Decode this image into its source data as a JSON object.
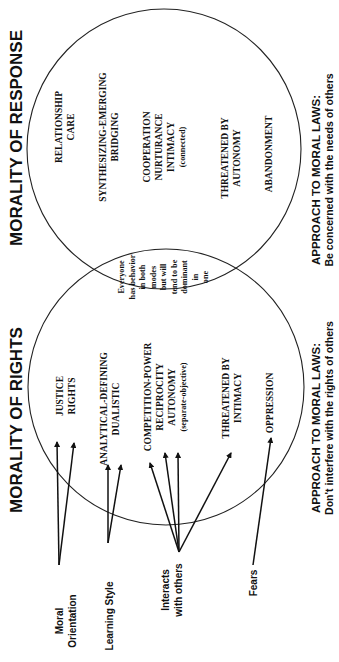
{
  "diagram": {
    "orientation": "rotated 90 degrees counter-clockwise",
    "response": {
      "title": "MORALITY OF RESPONSE",
      "lines": [
        [
          "RELATIONSHIP",
          "CARE"
        ],
        [
          "SYNTHESIZING-EMERGING",
          "BRIDGING"
        ],
        [
          "COOPERATION",
          "NURTURANCE",
          "INTIMACY",
          "(connected)"
        ],
        [
          "THREATENED BY",
          "AUTONOMY"
        ],
        [
          "ABANDONMENT"
        ]
      ],
      "approach_heading": "APPROACH TO MORAL LAWS:",
      "approach_text": "Be concerned with the needs of others"
    },
    "rights": {
      "title": "MORALITY OF RIGHTS",
      "lines": [
        [
          "JUSTICE",
          "RIGHTS"
        ],
        [
          "ANALYTICAL-DEFINING",
          "DUALISTIC"
        ],
        [
          "COMPETITION-POWER",
          "RECIPROCITY",
          "AUTONOMY",
          "(separate-objective)"
        ],
        [
          "THREATENED BY",
          "INTIMACY"
        ],
        [
          "OPPRESSION"
        ]
      ],
      "approach_heading": "APPROACH TO MORAL LAWS:",
      "approach_text": "Don't interfere with the rights of others"
    },
    "overlap": {
      "lines": [
        "Everyone",
        "has behavior",
        "in both",
        "modes",
        "but will",
        "tend to be",
        "dominant",
        "in",
        "one"
      ]
    },
    "categories": [
      {
        "key": "moral",
        "lines": [
          "Moral",
          "Orientation"
        ]
      },
      {
        "key": "learning",
        "lines": [
          "Learning Style"
        ]
      },
      {
        "key": "interacts",
        "lines": [
          "Interacts",
          "with others"
        ]
      },
      {
        "key": "fears",
        "lines": [
          "Fears"
        ]
      }
    ]
  }
}
